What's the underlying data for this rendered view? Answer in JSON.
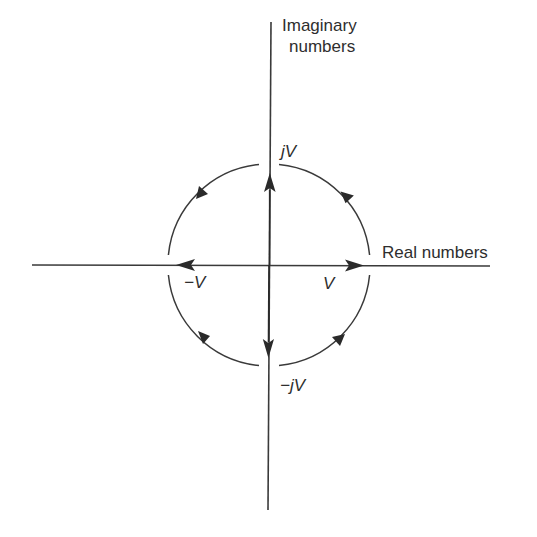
{
  "diagram": {
    "axes": {
      "vertical_label_line1": "Imaginary",
      "vertical_label_line2": "numbers",
      "horizontal_label": "Real numbers"
    },
    "points": {
      "top": "jV",
      "left": "−V",
      "right": "V",
      "bottom": "−jV"
    },
    "colors": {
      "line": "#3a3a3a",
      "text": "#2e2e2e",
      "background": "#ffffff"
    },
    "rotation_direction": "counterclockwise",
    "vectors": [
      {
        "name": "positive-real",
        "label": "V",
        "direction": "right"
      },
      {
        "name": "positive-imaginary",
        "label": "jV",
        "direction": "up"
      },
      {
        "name": "negative-real",
        "label": "−V",
        "direction": "left"
      },
      {
        "name": "negative-imaginary",
        "label": "−jV",
        "direction": "down"
      }
    ]
  }
}
